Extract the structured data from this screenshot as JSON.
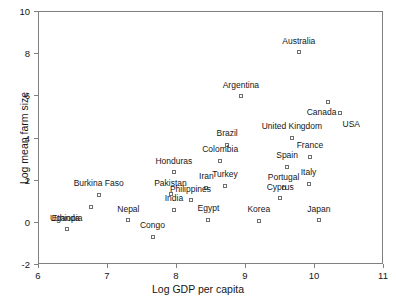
{
  "chart_data": {
    "type": "scatter",
    "title": "",
    "xlabel": "Log GDP per capita",
    "ylabel": "Log mean farm size",
    "xlim": [
      6,
      11
    ],
    "ylim": [
      -2,
      10
    ],
    "xticks": [
      6,
      7,
      8,
      9,
      10,
      11
    ],
    "yticks": [
      -2,
      0,
      2,
      4,
      6,
      8,
      10
    ],
    "grid": false,
    "legend": "none",
    "marker": "open-square",
    "points": [
      {
        "label": "Australia",
        "x": 9.78,
        "y": 8.05,
        "label_dx": 0,
        "label_dy": -0.55
      },
      {
        "label": "Argentina",
        "x": 8.94,
        "y": 5.95,
        "label_dx": 0,
        "label_dy": -0.55
      },
      {
        "label": "Canada",
        "x": 10.2,
        "y": 5.7,
        "label_dx": -0.09,
        "label_dy": 0.5
      },
      {
        "label": "USA",
        "x": 10.38,
        "y": 5.15,
        "label_dx": 0.16,
        "label_dy": 0.52
      },
      {
        "label": "Brazil",
        "x": 8.74,
        "y": 3.65,
        "label_dx": 0,
        "label_dy": -0.55
      },
      {
        "label": "United Kingdom",
        "x": 9.68,
        "y": 4.0,
        "label_dx": 0,
        "label_dy": -0.55
      },
      {
        "label": "France",
        "x": 9.94,
        "y": 3.1,
        "label_dx": 0,
        "label_dy": -0.55
      },
      {
        "label": "Colombia",
        "x": 8.64,
        "y": 2.9,
        "label_dx": 0,
        "label_dy": -0.55
      },
      {
        "label": "Spain",
        "x": 9.61,
        "y": 2.62,
        "label_dx": 0,
        "label_dy": -0.55
      },
      {
        "label": "Italy",
        "x": 9.92,
        "y": 1.82,
        "label_dx": 0,
        "label_dy": -0.55
      },
      {
        "label": "Honduras",
        "x": 7.97,
        "y": 2.35,
        "label_dx": 0,
        "label_dy": -0.55
      },
      {
        "label": "Portugal",
        "x": 9.56,
        "y": 1.6,
        "label_dx": 0,
        "label_dy": -0.55
      },
      {
        "label": "Turkey",
        "x": 8.71,
        "y": 1.72,
        "label_dx": 0,
        "label_dy": -0.55
      },
      {
        "label": "Iran",
        "x": 8.44,
        "y": 1.62,
        "label_dx": 0,
        "label_dy": -0.55
      },
      {
        "label": "Cyprus",
        "x": 9.51,
        "y": 1.11,
        "label_dx": 0,
        "label_dy": -0.55
      },
      {
        "label": "Burkina Faso",
        "x": 6.88,
        "y": 1.28,
        "label_dx": 0,
        "label_dy": -0.55
      },
      {
        "label": "Pakistan",
        "x": 7.92,
        "y": 1.3,
        "label_dx": 0,
        "label_dy": -0.55
      },
      {
        "label": "Philippines",
        "x": 8.21,
        "y": 1.02,
        "label_dx": 0,
        "label_dy": -0.55
      },
      {
        "label": "Uganda",
        "x": 6.77,
        "y": 0.72,
        "label_dx": -0.38,
        "label_dy": 0.52
      },
      {
        "label": "India",
        "x": 7.97,
        "y": 0.58,
        "label_dx": 0,
        "label_dy": -0.55
      },
      {
        "label": "Nepal",
        "x": 7.31,
        "y": 0.07,
        "label_dx": 0,
        "label_dy": -0.55
      },
      {
        "label": "Ethiopia",
        "x": 6.42,
        "y": -0.35,
        "label_dx": 0,
        "label_dy": -0.55
      },
      {
        "label": "Egypt",
        "x": 8.47,
        "y": 0.1,
        "label_dx": 0,
        "label_dy": -0.55
      },
      {
        "label": "Korea",
        "x": 9.2,
        "y": 0.05,
        "label_dx": 0,
        "label_dy": -0.55
      },
      {
        "label": "Japan",
        "x": 10.07,
        "y": 0.08,
        "label_dx": 0,
        "label_dy": -0.55
      },
      {
        "label": "Congo",
        "x": 7.66,
        "y": -0.7,
        "label_dx": 0,
        "label_dy": -0.55
      }
    ]
  }
}
